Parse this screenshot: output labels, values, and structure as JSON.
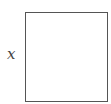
{
  "diagram": {
    "label": "x",
    "box": {
      "stroke_color": "#555555",
      "fill_color": "#ffffff"
    }
  }
}
